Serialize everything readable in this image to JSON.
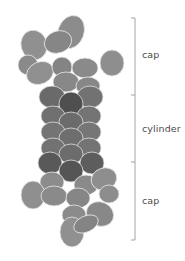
{
  "diagram": {
    "type": "molecular-assembly-schematic",
    "colors": {
      "cap_fill": "#8f8f8f",
      "cap_fill_dark": "#7d7d7d",
      "cylinder_fill": "#6e6e6e",
      "cylinder_fill_dark": "#555555",
      "outline": "#e6e6e6",
      "bracket": "#9a9a9a",
      "label_text": "#4a4a4a"
    },
    "regions": [
      {
        "id": "top-cap",
        "label": "cap"
      },
      {
        "id": "cylinder",
        "label": "cylinder"
      },
      {
        "id": "bottom-cap",
        "label": "cap"
      }
    ],
    "bracket": {
      "x": 135,
      "y_top": 18,
      "y_div1": 95,
      "y_div2": 162,
      "y_bottom": 240
    }
  }
}
